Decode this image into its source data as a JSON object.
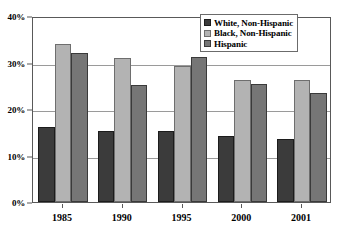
{
  "chart_data": {
    "type": "bar",
    "title": "",
    "subtitle": "",
    "xlabel": "",
    "ylabel": "",
    "categories": [
      "1985",
      "1990",
      "1995",
      "2000",
      "2001"
    ],
    "series": [
      {
        "name": "White, Non-Hispanic",
        "color": "#3b3b3b",
        "values": [
          16.1,
          15.2,
          15.3,
          14.3,
          13.5
        ]
      },
      {
        "name": "Black, Non-Hispanic",
        "color": "#b3b3b3",
        "values": [
          34.0,
          31.0,
          29.3,
          26.2,
          26.3
        ]
      },
      {
        "name": "Hispanic",
        "color": "#767676",
        "values": [
          32.0,
          25.2,
          31.1,
          25.4,
          23.4
        ]
      }
    ],
    "ylim": [
      0,
      40
    ],
    "yticks": [
      0,
      10,
      20,
      30,
      40
    ],
    "ytick_labels": [
      "0%",
      "10%",
      "20%",
      "30%",
      "40%"
    ],
    "grid": true,
    "grid_axis": "y",
    "legend_position": "top-right",
    "legend_entries": [
      "White, Non-Hispanic",
      "Black, Non-Hispanic",
      "Hispanic"
    ],
    "annotations": []
  }
}
